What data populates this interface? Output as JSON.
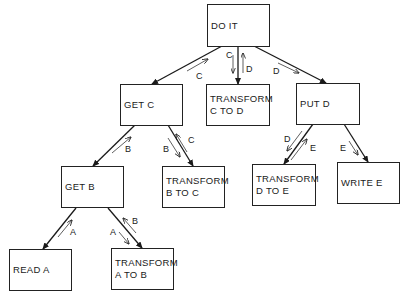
{
  "diagram": {
    "type": "hierarchy",
    "nodes": [
      {
        "id": "do_it",
        "lines": [
          "DO IT"
        ]
      },
      {
        "id": "get_c",
        "lines": [
          "GET C"
        ]
      },
      {
        "id": "transform_c_to_d",
        "lines": [
          "TRANSFORM",
          "C TO D"
        ]
      },
      {
        "id": "put_d",
        "lines": [
          "PUT D"
        ]
      },
      {
        "id": "get_b",
        "lines": [
          "GET B"
        ]
      },
      {
        "id": "transform_b_to_c",
        "lines": [
          "TRANSFORM",
          "B TO C"
        ]
      },
      {
        "id": "transform_d_to_e",
        "lines": [
          "TRANSFORM",
          "D TO E"
        ]
      },
      {
        "id": "write_e",
        "lines": [
          "WRITE E"
        ]
      },
      {
        "id": "read_a",
        "lines": [
          "READ A"
        ]
      },
      {
        "id": "transform_a_to_b",
        "lines": [
          "TRANSFORM",
          "A TO B"
        ]
      }
    ],
    "edges": [
      {
        "from": "do_it",
        "to": "get_c",
        "flows": [
          {
            "label": "C",
            "direction": "up"
          }
        ]
      },
      {
        "from": "do_it",
        "to": "transform_c_to_d",
        "flows": [
          {
            "label": "C",
            "direction": "down"
          },
          {
            "label": "D",
            "direction": "up"
          }
        ]
      },
      {
        "from": "do_it",
        "to": "put_d",
        "flows": [
          {
            "label": "D",
            "direction": "down"
          }
        ]
      },
      {
        "from": "get_c",
        "to": "get_b",
        "flows": [
          {
            "label": "B",
            "direction": "up"
          }
        ]
      },
      {
        "from": "get_c",
        "to": "transform_b_to_c",
        "flows": [
          {
            "label": "B",
            "direction": "down"
          },
          {
            "label": "C",
            "direction": "up"
          }
        ]
      },
      {
        "from": "put_d",
        "to": "transform_d_to_e",
        "flows": [
          {
            "label": "D",
            "direction": "down"
          },
          {
            "label": "E",
            "direction": "up"
          }
        ]
      },
      {
        "from": "put_d",
        "to": "write_e",
        "flows": [
          {
            "label": "E",
            "direction": "down"
          }
        ]
      },
      {
        "from": "get_b",
        "to": "read_a",
        "flows": [
          {
            "label": "A",
            "direction": "up"
          }
        ]
      },
      {
        "from": "get_b",
        "to": "transform_a_to_b",
        "flows": [
          {
            "label": "A",
            "direction": "down"
          },
          {
            "label": "B",
            "direction": "up"
          }
        ]
      }
    ]
  },
  "labels": {
    "do_it_get_c": "C",
    "do_it_tcd_down": "C",
    "do_it_tcd_up": "D",
    "do_it_put_d": "D",
    "get_c_get_b": "B",
    "get_c_tbc_down": "B",
    "get_c_tbc_up": "C",
    "put_d_tde_down": "D",
    "put_d_tde_up": "E",
    "put_d_write_e": "E",
    "get_b_read_a": "A",
    "get_b_tab_down": "A",
    "get_b_tab_up": "B"
  },
  "nodes": {
    "do_it": {
      "l1": "DO IT"
    },
    "get_c": {
      "l1": "GET C"
    },
    "transform_c_to_d": {
      "l1": "TRANSFORM",
      "l2": "C TO D"
    },
    "put_d": {
      "l1": "PUT D"
    },
    "get_b": {
      "l1": "GET B"
    },
    "transform_b_to_c": {
      "l1": "TRANSFORM",
      "l2": "B TO C"
    },
    "transform_d_to_e": {
      "l1": "TRANSFORM",
      "l2": "D TO E"
    },
    "write_e": {
      "l1": "WRITE E"
    },
    "read_a": {
      "l1": "READ A"
    },
    "transform_a_to_b": {
      "l1": "TRANSFORM",
      "l2": "A TO B"
    }
  }
}
